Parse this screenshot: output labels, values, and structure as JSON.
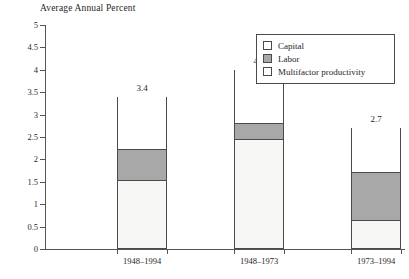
{
  "chart_data": {
    "type": "bar",
    "subtype": "stacked-bar",
    "title": "Average Annual Percent",
    "xlabel": "",
    "ylabel": "Average Annual Percent",
    "ylim": [
      0,
      5
    ],
    "grid": false,
    "legend_position": "top-right",
    "categories": [
      "1948–1994",
      "1948–1973",
      "1973–1994"
    ],
    "ytick_labels": [
      "5",
      "4.5",
      "4",
      "3.5",
      "3",
      "2.5",
      "2",
      "1.5",
      "1",
      "0.5",
      "0"
    ],
    "ytick_values": [
      5,
      4.5,
      4,
      3.5,
      3,
      2.5,
      2,
      1.5,
      1,
      0.5,
      0
    ],
    "series": [
      {
        "name": "Multifactor productivity",
        "color": "#f7f7f5",
        "values": [
          1.5,
          2.4,
          0.6
        ]
      },
      {
        "name": "Labor",
        "color": "#a8a8a8",
        "values": [
          0.7,
          0.4,
          1.1
        ]
      },
      {
        "name": "Capital",
        "color": "#ffffff",
        "values": [
          1.2,
          1.2,
          1.0
        ]
      }
    ],
    "totals": [
      3.4,
      4.0,
      2.7
    ],
    "total_labels": [
      "3.4",
      "4.0",
      "2.7"
    ]
  },
  "legend": {
    "items": [
      {
        "label": "Capital",
        "swatch": "#ffffff"
      },
      {
        "label": "Labor",
        "swatch": "#a8a8a8"
      },
      {
        "label": "Multifactor productivity",
        "swatch": "#fdfdfb"
      }
    ]
  },
  "colors": {
    "axis": "#555555",
    "bar_border": "#4a4a4a",
    "capital": "#ffffff",
    "labor": "#a8a8a8",
    "multifactor": "#f7f7f5",
    "background": "#ffffff",
    "text": "#1f1f1f"
  }
}
